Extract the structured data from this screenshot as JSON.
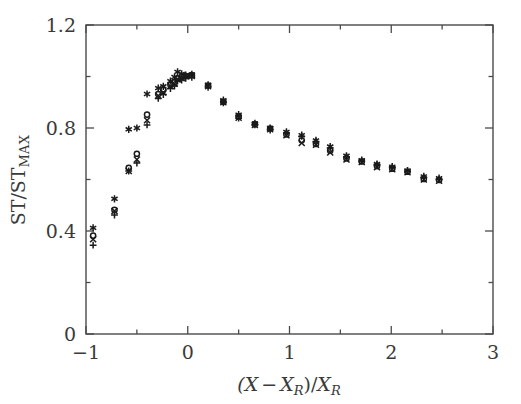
{
  "figure": {
    "background_color": "#ffffff",
    "frame_color": "#4a4a4a",
    "marker_color": "#1a1a1a"
  },
  "chart_data": {
    "type": "scatter",
    "title": "",
    "xlabel": "(X−X_R)/X_R",
    "ylabel": "ST/ST_MAX",
    "xlim": [
      -1,
      3
    ],
    "ylim": [
      0,
      1.2
    ],
    "grid": false,
    "legend": null,
    "x_major_ticks": [
      -1,
      0,
      1,
      2,
      3
    ],
    "x_major_tick_labels": [
      "−1",
      "0",
      "1",
      "2",
      "3"
    ],
    "x_minor_ticks": [
      -0.5,
      0.5,
      1.5,
      2.5
    ],
    "y_major_ticks": [
      0,
      0.4,
      0.8,
      1.2
    ],
    "y_major_tick_labels": [
      "0",
      "0.4",
      "0.8",
      "1.2"
    ],
    "y_minor_ticks": [
      0.2,
      0.6,
      1.0
    ],
    "series": [
      {
        "name": "series-plus",
        "marker": "plus",
        "points": [
          [
            -0.93,
            0.345
          ],
          [
            -0.72,
            0.462
          ],
          [
            -0.58,
            0.633
          ],
          [
            -0.5,
            0.664
          ],
          [
            -0.4,
            0.812
          ],
          [
            -0.29,
            0.915
          ],
          [
            -0.24,
            0.93
          ],
          [
            -0.17,
            0.953
          ],
          [
            -0.13,
            0.963
          ],
          [
            -0.1,
            0.982
          ],
          [
            -0.06,
            0.986
          ],
          [
            -0.02,
            0.993
          ],
          [
            0.04,
            0.997
          ],
          [
            0.2,
            0.958
          ],
          [
            0.35,
            0.898
          ],
          [
            0.5,
            0.838
          ],
          [
            0.66,
            0.812
          ],
          [
            0.81,
            0.792
          ],
          [
            0.97,
            0.78
          ],
          [
            1.12,
            0.768
          ],
          [
            1.26,
            0.748
          ],
          [
            1.4,
            0.722
          ],
          [
            1.56,
            0.688
          ],
          [
            1.71,
            0.672
          ],
          [
            1.86,
            0.658
          ],
          [
            2.01,
            0.648
          ],
          [
            2.16,
            0.632
          ],
          [
            2.32,
            0.608
          ],
          [
            2.47,
            0.6
          ]
        ]
      },
      {
        "name": "series-cross",
        "marker": "cross",
        "points": [
          [
            -0.93,
            0.368
          ],
          [
            -0.72,
            0.478
          ],
          [
            -0.58,
            0.633
          ],
          [
            -0.5,
            0.678
          ],
          [
            -0.4,
            0.83
          ],
          [
            -0.29,
            0.925
          ],
          [
            -0.24,
            0.938
          ],
          [
            -0.17,
            0.962
          ],
          [
            -0.13,
            0.972
          ],
          [
            -0.1,
            0.988
          ],
          [
            -0.06,
            0.993
          ],
          [
            -0.02,
            1.0
          ],
          [
            0.04,
            1.002
          ],
          [
            0.2,
            0.962
          ],
          [
            0.35,
            0.9
          ],
          [
            0.5,
            0.84
          ],
          [
            0.66,
            0.812
          ],
          [
            0.81,
            0.795
          ],
          [
            0.97,
            0.772
          ],
          [
            1.12,
            0.742
          ],
          [
            1.26,
            0.735
          ],
          [
            1.4,
            0.705
          ],
          [
            1.56,
            0.678
          ],
          [
            1.71,
            0.668
          ],
          [
            1.86,
            0.648
          ],
          [
            2.01,
            0.64
          ],
          [
            2.16,
            0.628
          ],
          [
            2.32,
            0.6
          ],
          [
            2.47,
            0.595
          ]
        ]
      },
      {
        "name": "series-circle",
        "marker": "circle",
        "points": [
          [
            -0.93,
            0.382
          ],
          [
            -0.72,
            0.482
          ],
          [
            -0.58,
            0.645
          ],
          [
            -0.5,
            0.7
          ],
          [
            -0.4,
            0.852
          ],
          [
            -0.29,
            0.932
          ],
          [
            -0.24,
            0.948
          ],
          [
            -0.17,
            0.968
          ],
          [
            -0.13,
            0.978
          ],
          [
            -0.1,
            0.992
          ],
          [
            -0.06,
            0.998
          ],
          [
            -0.02,
            1.002
          ],
          [
            0.04,
            1.005
          ],
          [
            0.2,
            0.965
          ],
          [
            0.35,
            0.902
          ],
          [
            0.5,
            0.845
          ],
          [
            0.66,
            0.815
          ],
          [
            0.81,
            0.798
          ],
          [
            0.97,
            0.775
          ],
          [
            1.12,
            0.752
          ],
          [
            1.26,
            0.738
          ],
          [
            1.4,
            0.712
          ],
          [
            1.56,
            0.682
          ],
          [
            1.71,
            0.67
          ],
          [
            1.86,
            0.652
          ],
          [
            2.01,
            0.642
          ],
          [
            2.16,
            0.63
          ],
          [
            2.32,
            0.602
          ],
          [
            2.47,
            0.598
          ]
        ]
      },
      {
        "name": "series-star",
        "marker": "star",
        "points": [
          [
            -0.93,
            0.412
          ],
          [
            -0.72,
            0.525
          ],
          [
            -0.58,
            0.795
          ],
          [
            -0.5,
            0.8
          ],
          [
            -0.4,
            0.932
          ],
          [
            -0.29,
            0.955
          ],
          [
            -0.24,
            0.962
          ],
          [
            -0.17,
            0.982
          ],
          [
            -0.13,
            0.998
          ],
          [
            -0.1,
            1.018
          ],
          [
            -0.06,
            1.01
          ],
          [
            -0.02,
            1.005
          ],
          [
            0.04,
            1.008
          ],
          [
            0.2,
            0.968
          ],
          [
            0.35,
            0.908
          ],
          [
            0.5,
            0.852
          ],
          [
            0.66,
            0.818
          ],
          [
            0.81,
            0.8
          ],
          [
            0.97,
            0.785
          ],
          [
            1.12,
            0.772
          ],
          [
            1.26,
            0.752
          ],
          [
            1.4,
            0.728
          ],
          [
            1.56,
            0.692
          ],
          [
            1.71,
            0.675
          ],
          [
            1.86,
            0.66
          ],
          [
            2.01,
            0.65
          ],
          [
            2.16,
            0.635
          ],
          [
            2.32,
            0.612
          ],
          [
            2.47,
            0.605
          ]
        ]
      }
    ]
  }
}
